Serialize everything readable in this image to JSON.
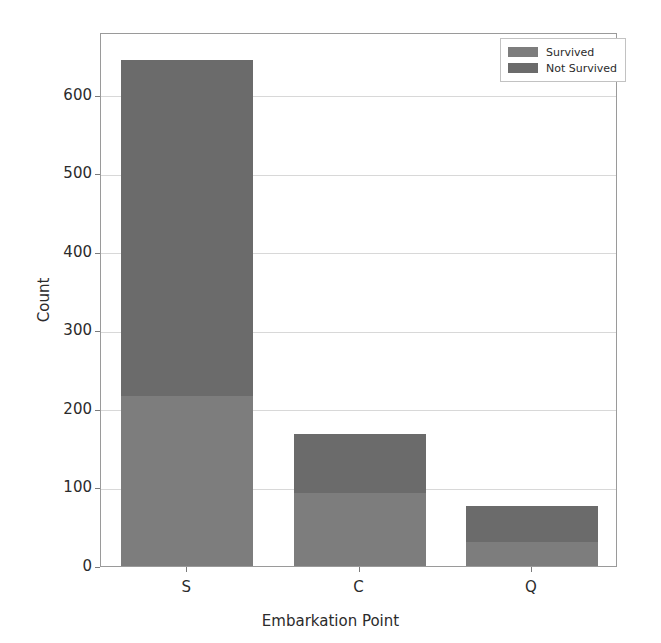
{
  "chart_data": {
    "type": "bar",
    "subtype": "stacked-bar",
    "title": "",
    "xlabel": "Embarkation Point",
    "ylabel": "Count",
    "categories": [
      "S",
      "C",
      "Q"
    ],
    "series": [
      {
        "name": "Survived",
        "values": [
          217,
          93,
          30
        ],
        "color": "#7d7d7d"
      },
      {
        "name": "Not Survived",
        "values": [
          427,
          75,
          47
        ],
        "color": "#6b6b6b"
      }
    ],
    "totals": [
      644,
      168,
      77
    ],
    "ylim": [
      0,
      680
    ],
    "yticks": [
      0,
      100,
      200,
      300,
      400,
      500,
      600
    ],
    "ytick_labels": [
      "0",
      "100",
      "200",
      "300",
      "400",
      "500",
      "600"
    ],
    "xtick_labels": [
      "S",
      "C",
      "Q"
    ],
    "grid": true,
    "grid_axis": "y",
    "legend_position": "upper right",
    "legend_entries": [
      "Survived",
      "Not Survived"
    ],
    "stack_order": [
      "Survived",
      "Not Survived"
    ],
    "background": "#ffffff",
    "axis_color": "#9a9a9a",
    "grid_color": "#d8d8d8"
  }
}
